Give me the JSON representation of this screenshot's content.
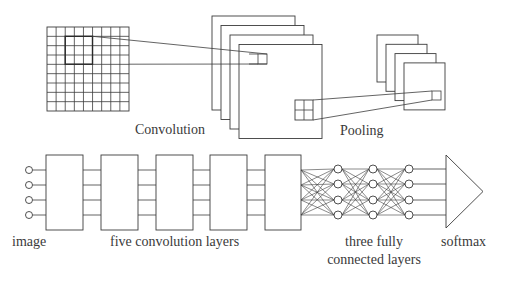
{
  "top": {
    "input_grid": {
      "x": 47,
      "y": 27,
      "w": 82,
      "h": 84,
      "cols": 9,
      "rows": 9,
      "highlight": {
        "x": 65.2,
        "y": 36.3,
        "w": 27.3,
        "h": 27.9
      }
    },
    "conv_stack": {
      "x": 212,
      "y": 16,
      "w": 83,
      "h": 94,
      "count": 4,
      "dx": 9,
      "dy": 9.5
    },
    "conv_kernel": {
      "x": 249,
      "y": 54,
      "w": 18,
      "h": 10,
      "divider_x": 258
    },
    "conv_pool_window": {
      "x": 295,
      "y": 100,
      "w": 18,
      "h": 20
    },
    "pool_stack": {
      "x": 377,
      "y": 35,
      "w": 41,
      "h": 47,
      "count": 4,
      "dx": 9,
      "dy": 9.3
    },
    "pool_output": {
      "x": 432,
      "y": 91,
      "w": 9,
      "h": 9
    },
    "labels": {
      "convolution": "Convolution",
      "pooling": "Pooling"
    }
  },
  "bottom": {
    "input_nodes": {
      "cx": 29,
      "r": 3.5,
      "ys": [
        170,
        185,
        200,
        215
      ]
    },
    "row_ys": [
      170,
      185,
      200,
      215
    ],
    "conv_boxes": [
      {
        "x": 46,
        "w": 37
      },
      {
        "x": 101,
        "w": 37
      },
      {
        "x": 156,
        "w": 37
      },
      {
        "x": 210,
        "w": 37
      },
      {
        "x": 265,
        "w": 36
      }
    ],
    "box_top": 155,
    "box_bottom": 230,
    "fc_columns_x": [
      338,
      373,
      409
    ],
    "fc_node_ys": [
      169,
      184,
      200,
      215
    ],
    "fc_node_r": 4,
    "softmax": {
      "x": 446,
      "top": 155,
      "bottom": 228,
      "tip_x": 483,
      "tip_y": 191.5
    },
    "labels": {
      "image": "image",
      "conv_layers": "five convolution layers",
      "fc_line1": "three fully",
      "fc_line2": "connected layers",
      "softmax": "softmax"
    }
  }
}
